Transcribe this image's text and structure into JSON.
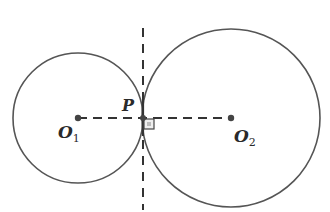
{
  "diagram": {
    "type": "two externally tangent circles with common tangent line",
    "colors": {
      "stroke": "#555555",
      "dash": "#333333",
      "background": "#ffffff"
    },
    "circle_small": {
      "center_label": "O",
      "center_subscript": "1",
      "cx": 78,
      "cy": 118,
      "r": 65
    },
    "circle_large": {
      "center_label": "O",
      "center_subscript": "2",
      "cx": 231,
      "cy": 118,
      "r": 89
    },
    "tangent_point": {
      "label": "P",
      "x": 143,
      "y": 118
    },
    "center_line": {
      "style": "dashed",
      "from": "O1",
      "to": "O2"
    },
    "tangent_line": {
      "style": "dashed",
      "orientation": "vertical",
      "through": "P"
    },
    "right_angle_marker": {
      "at": "P"
    }
  }
}
